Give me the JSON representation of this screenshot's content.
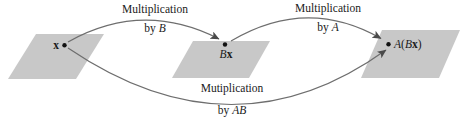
{
  "colors": {
    "background": "#ffffff",
    "plane_fill": "#c8c8c8",
    "arrow": "#6e6e6e",
    "arrowhead": "#4a4a4a",
    "dot": "#111111",
    "text": "#1a1a1a"
  },
  "labels": {
    "top_left": {
      "line1": "Multiplication",
      "by": "by ",
      "var": "B"
    },
    "top_right": {
      "line1": "Multiplication",
      "by": "by ",
      "var": "A"
    },
    "bottom": {
      "line1": "Mutiplication",
      "by": "by ",
      "var": "AB"
    }
  },
  "points": {
    "x": {
      "vec": "x"
    },
    "bx": {
      "var": "B",
      "vec": "x"
    },
    "abx": {
      "var": "A",
      "open": "(",
      "var2": "B",
      "vec": "x",
      "close": ")"
    }
  }
}
